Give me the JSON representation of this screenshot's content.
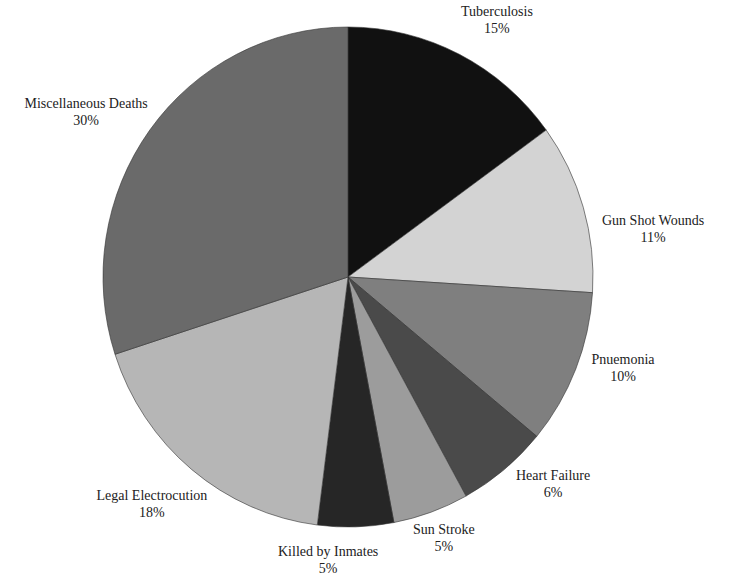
{
  "chart_data": {
    "type": "pie",
    "title": "",
    "start_angle_deg": 0,
    "direction": "clockwise",
    "slices": [
      {
        "label": "Tuberculosis",
        "value": 15,
        "pct_label": "15%",
        "color": "#111111"
      },
      {
        "label": "Gun Shot Wounds",
        "value": 11,
        "pct_label": "11%",
        "color": "#d3d3d3"
      },
      {
        "label": "Pnuemonia",
        "value": 10,
        "pct_label": "10%",
        "color": "#7f7f7f"
      },
      {
        "label": "Heart Failure",
        "value": 6,
        "pct_label": "6%",
        "color": "#4a4a4a"
      },
      {
        "label": "Sun Stroke",
        "value": 5,
        "pct_label": "5%",
        "color": "#9c9c9c"
      },
      {
        "label": "Killed by Inmates",
        "value": 5,
        "pct_label": "5%",
        "color": "#262626"
      },
      {
        "label": "Legal Electrocution",
        "value": 18,
        "pct_label": "18%",
        "color": "#b6b6b6"
      },
      {
        "label": "Miscellaneous Deaths",
        "value": 30,
        "pct_label": "30%",
        "color": "#6a6a6a"
      }
    ]
  },
  "labels": [
    {
      "name": "Tuberculosis",
      "pct": "15%",
      "x": 497,
      "y": 3
    },
    {
      "name": "Gun Shot Wounds",
      "pct": "11%",
      "x": 653,
      "y": 212
    },
    {
      "name": "Pnuemonia",
      "pct": "10%",
      "x": 623,
      "y": 351
    },
    {
      "name": "Heart Failure",
      "pct": "6%",
      "x": 553,
      "y": 467
    },
    {
      "name": "Sun Stroke",
      "pct": "5%",
      "x": 444,
      "y": 521
    },
    {
      "name": "Killed by Inmates",
      "pct": "5%",
      "x": 328,
      "y": 543
    },
    {
      "name": "Legal Electrocution",
      "pct": "18%",
      "x": 152,
      "y": 487
    },
    {
      "name": "Miscellaneous Deaths",
      "pct": "30%",
      "x": 86,
      "y": 95
    }
  ]
}
